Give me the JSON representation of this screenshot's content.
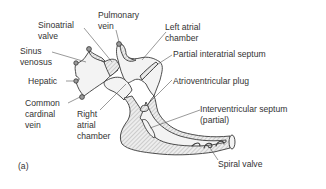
{
  "figure": {
    "panel_label": "(a)",
    "labels": {
      "sinoatrial_valve": [
        "Sinoatrial",
        "valve"
      ],
      "pulmonary_vein": [
        "Pulmonary",
        "vein"
      ],
      "left_atrial_chamber": [
        "Left atrial",
        "chamber"
      ],
      "sinus_venosus": [
        "Sinus",
        "venosus"
      ],
      "partial_interatrial_septum": [
        "Partial interatrial septum"
      ],
      "hepatic": [
        "Hepatic"
      ],
      "atrioventricular_plug": [
        "Atrioventricular plug"
      ],
      "common_cardinal_vein": [
        "Common",
        "cardinal",
        "vein"
      ],
      "right_atrial_chamber": [
        "Right",
        "atrial",
        "chamber"
      ],
      "interventricular_septum": [
        "Interventricular septum",
        "(partial)"
      ],
      "spiral_valve": [
        "Spiral valve"
      ]
    }
  }
}
